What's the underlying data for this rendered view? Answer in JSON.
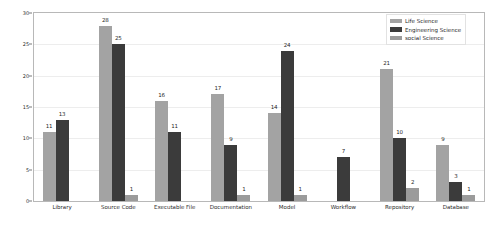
{
  "chart_data": {
    "type": "bar",
    "title": "",
    "xlabel": "",
    "ylabel": "",
    "ylim": [
      0,
      30
    ],
    "yticks": [
      0,
      5,
      10,
      15,
      20,
      25,
      30
    ],
    "grid": true,
    "legend_position": "upper right",
    "categories": [
      "Library",
      "Source Code",
      "Executable File",
      "Documentation",
      "Model",
      "Workflow",
      "Repository",
      "Database"
    ],
    "series": [
      {
        "name": "Life Science",
        "color": "#a3a3a3",
        "values": [
          11,
          28,
          16,
          17,
          14,
          null,
          21,
          9
        ]
      },
      {
        "name": "Engineering Science",
        "color": "#3b3b3b",
        "values": [
          13,
          25,
          11,
          9,
          24,
          7,
          10,
          3
        ]
      },
      {
        "name": "social Science",
        "color": "#9b9b9b",
        "values": [
          null,
          1,
          null,
          1,
          1,
          null,
          2,
          1
        ]
      }
    ]
  },
  "legend": {
    "items": [
      {
        "label": "Life Science",
        "color": "#a3a3a3"
      },
      {
        "label": "Engineering Science",
        "color": "#3b3b3b"
      },
      {
        "label": "social Science",
        "color": "#9b9b9b"
      }
    ]
  },
  "axis": {
    "y_tick_labels": [
      "0",
      "5",
      "10",
      "15",
      "20",
      "25",
      "30"
    ]
  }
}
